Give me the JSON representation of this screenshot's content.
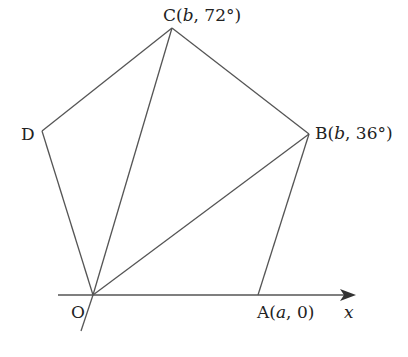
{
  "diagram": {
    "type": "pentagon-on-polar-axis",
    "colors": {
      "line": "#555555",
      "text": "#222222",
      "background": "#ffffff"
    },
    "points": {
      "O": {
        "label": "O",
        "coord_text": ""
      },
      "A": {
        "label": "A",
        "coord_open": "(",
        "coord_r": "a",
        "coord_sep": ", ",
        "coord_theta": "0",
        "coord_close": ")"
      },
      "B": {
        "label": "B",
        "coord_open": "(",
        "coord_r": "b",
        "coord_sep": ", ",
        "coord_theta": "36°",
        "coord_close": ")"
      },
      "C": {
        "label": "C",
        "coord_open": "(",
        "coord_r": "b",
        "coord_sep": ", ",
        "coord_theta": "72°",
        "coord_close": ")"
      },
      "D": {
        "label": "D"
      }
    },
    "axis": {
      "label": "x"
    },
    "edges": [
      "OA",
      "AB",
      "BC",
      "CD",
      "DO"
    ],
    "diagonals": [
      "OB",
      "OC"
    ]
  }
}
